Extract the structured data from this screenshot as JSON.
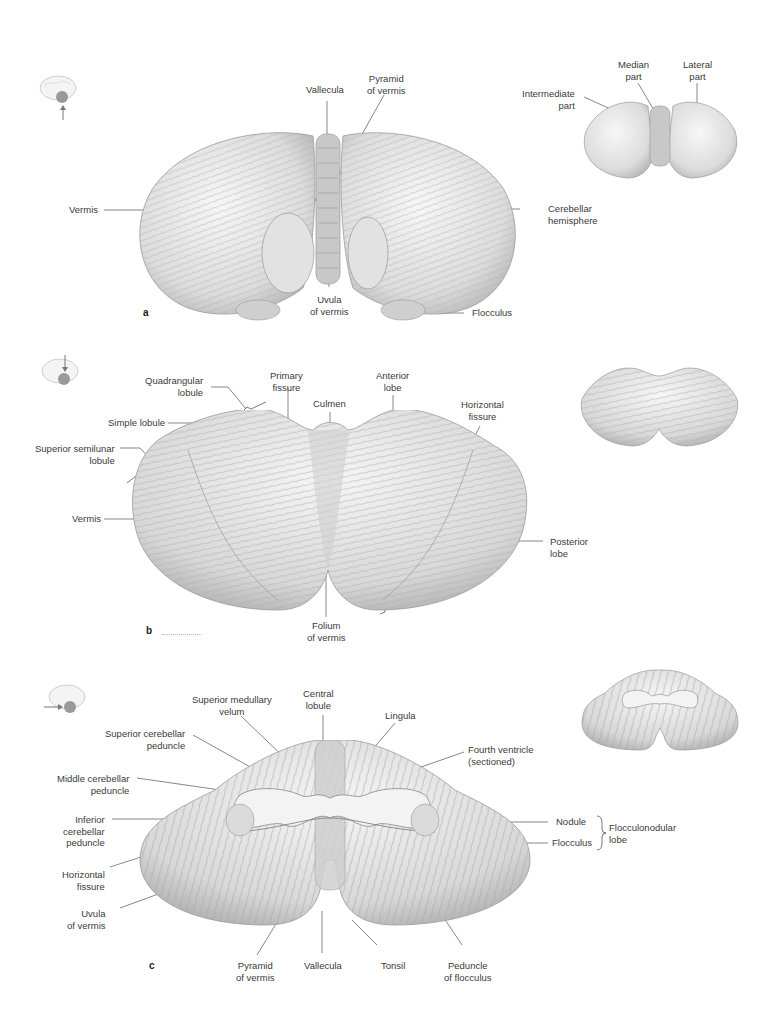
{
  "figure": {
    "panels": [
      {
        "id": "a",
        "letter": "a",
        "view": "inferior",
        "labels": {
          "vallecula": "Vallecula",
          "pyramid_of_vermis": [
            "Pyramid",
            "of vermis"
          ],
          "vermis": "Vermis",
          "uvula_of_vermis": [
            "Uvula",
            "of vermis"
          ],
          "cerebellar_hemisphere": [
            "Cerebellar",
            "hemisphere"
          ],
          "flocculus": "Flocculus"
        },
        "inset_labels": {
          "median_part": [
            "Median",
            "part"
          ],
          "lateral_part": [
            "Lateral",
            "part"
          ],
          "intermediate_part": [
            "Intermediate",
            "part"
          ]
        }
      },
      {
        "id": "b",
        "letter": "b",
        "view": "superior",
        "labels": {
          "quadrangular_lobule": [
            "Quadrangular",
            "lobule"
          ],
          "simple_lobule": "Simple lobule",
          "superior_semilunar_lobule": [
            "Superior semilunar",
            "lobule"
          ],
          "primary_fissure": [
            "Primary",
            "fissure"
          ],
          "culmen": "Culmen",
          "anterior_lobe": [
            "Anterior",
            "lobe"
          ],
          "horizontal_fissure": [
            "Horizontal",
            "fissure"
          ],
          "vermis": "Vermis",
          "posterior_lobe": [
            "Posterior",
            "lobe"
          ],
          "folium_of_vermis": [
            "Folium",
            "of vermis"
          ]
        }
      },
      {
        "id": "c",
        "letter": "c",
        "view": "anterior",
        "labels": {
          "central_lobule": [
            "Central",
            "lobule"
          ],
          "superior_medullary_velum": [
            "Superior medullary",
            "velum"
          ],
          "lingula": "Lingula",
          "superior_cerebellar_peduncle": [
            "Superior cerebellar",
            "peduncle"
          ],
          "fourth_ventricle": [
            "Fourth ventricle",
            "(sectioned)"
          ],
          "middle_cerebellar_peduncle": [
            "Middle cerebellar",
            "peduncle"
          ],
          "inferior_cerebellar_peduncle": [
            "Inferior",
            "cerebellar",
            "peduncle"
          ],
          "nodule": "Nodule",
          "flocculus": "Flocculus",
          "flocculonodular_lobe": [
            "Flocculonodular",
            "lobe"
          ],
          "horizontal_fissure": [
            "Horizontal",
            "fissure"
          ],
          "uvula_of_vermis": [
            "Uvula",
            "of vermis"
          ],
          "pyramid_of_vermis": [
            "Pyramid",
            "of vermis"
          ],
          "vallecula": "Vallecula",
          "tonsil": "Tonsil",
          "peduncle_of_flocculus": [
            "Peduncle",
            "of flocculus"
          ]
        }
      }
    ],
    "colors": {
      "tissue_light": "#f2f2f2",
      "tissue_mid": "#d4d4d4",
      "tissue_dark": "#9a9a9a",
      "leader_line": "#555555",
      "text": "#3a3a3a"
    }
  }
}
